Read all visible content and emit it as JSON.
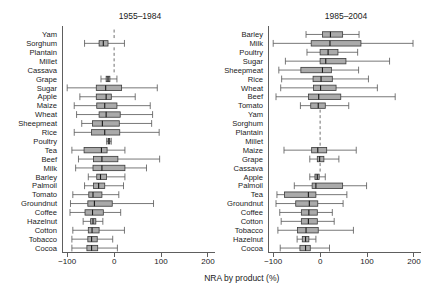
{
  "figure": {
    "axis_title": "NRA by product (%)",
    "tick_labels": [
      "-100",
      "0",
      "100",
      "200"
    ],
    "tick_values": [
      -100,
      0,
      100,
      200
    ],
    "axis_min": -110,
    "axis_max": 215,
    "box_fill_color": "#aaaaaa",
    "box_stroke_color": "#3a3a3a",
    "whisker_color": "#555555",
    "axis_color": "#4d4d4d"
  },
  "chart_data": {
    "type": "box",
    "title": "",
    "xlabel": "NRA by product (%)",
    "ylabel": "",
    "xlim": [
      -110,
      215
    ],
    "grid": false,
    "legend": "none",
    "panels": [
      {
        "label": "1955–1984",
        "categories": [
          "Yam",
          "Sorghum",
          "Plantain",
          "Millet",
          "Cassava",
          "Grape",
          "Sugar",
          "Apple",
          "Maize",
          "Wheat",
          "Sheepmeat",
          "Rice",
          "Poultry",
          "Tea",
          "Beef",
          "Milk",
          "Barley",
          "Palmoil",
          "Tomato",
          "Groundnut",
          "Coffee",
          "Hazelnut",
          "Cotton",
          "Tobacco",
          "Cocoa"
        ],
        "boxes": [
          {
            "category": "Yam",
            "empty": true
          },
          {
            "category": "Sorghum",
            "min": -63,
            "q1": -32,
            "median": -23,
            "q3": -13,
            "max": 22
          },
          {
            "category": "Plantain",
            "empty": true
          },
          {
            "category": "Millet",
            "empty": true
          },
          {
            "category": "Cassava",
            "empty": true
          },
          {
            "category": "Grape",
            "min": -28,
            "q1": -17,
            "median": -13,
            "q3": -9,
            "max": 6
          },
          {
            "category": "Sugar",
            "min": -100,
            "q1": -38,
            "median": -18,
            "q3": 16,
            "max": 92
          },
          {
            "category": "Apple",
            "min": -73,
            "q1": -38,
            "median": -17,
            "q3": -6,
            "max": 45
          },
          {
            "category": "Maize",
            "min": -85,
            "q1": -37,
            "median": -20,
            "q3": 6,
            "max": 77
          },
          {
            "category": "Wheat",
            "min": -80,
            "q1": -32,
            "median": -17,
            "q3": 13,
            "max": 82
          },
          {
            "category": "Sheepmeat",
            "min": -69,
            "q1": -46,
            "median": -25,
            "q3": 11,
            "max": 80
          },
          {
            "category": "Rice",
            "min": -85,
            "q1": -48,
            "median": -20,
            "q3": 12,
            "max": 96
          },
          {
            "category": "Poultry",
            "min": -16,
            "q1": -13,
            "median": -11,
            "q3": -9,
            "max": -6
          },
          {
            "category": "Tea",
            "min": -90,
            "q1": -64,
            "median": -27,
            "q3": -15,
            "max": 23
          },
          {
            "category": "Beef",
            "min": -76,
            "q1": -44,
            "median": -26,
            "q3": 8,
            "max": 97
          },
          {
            "category": "Milk",
            "min": -82,
            "q1": -45,
            "median": -26,
            "q3": 23,
            "max": 69
          },
          {
            "category": "Barley",
            "min": -55,
            "q1": -37,
            "median": -29,
            "q3": -16,
            "max": 23
          },
          {
            "category": "Palmoil",
            "min": -63,
            "q1": -44,
            "median": -33,
            "q3": -20,
            "max": 20
          },
          {
            "category": "Tomato",
            "min": -88,
            "q1": -54,
            "median": -45,
            "q3": -26,
            "max": 10
          },
          {
            "category": "Groundnut",
            "min": -93,
            "q1": -56,
            "median": -42,
            "q3": -4,
            "max": 84
          },
          {
            "category": "Coffee",
            "min": -94,
            "q1": -62,
            "median": -46,
            "q3": -23,
            "max": 14
          },
          {
            "category": "Hazelnut",
            "min": -66,
            "q1": -50,
            "median": -45,
            "q3": -39,
            "max": -24
          },
          {
            "category": "Cotton",
            "min": -88,
            "q1": -55,
            "median": -47,
            "q3": -32,
            "max": 22
          },
          {
            "category": "Tobacco",
            "min": -90,
            "q1": -56,
            "median": -48,
            "q3": -36,
            "max": -3
          },
          {
            "category": "Cocoa",
            "min": -90,
            "q1": -58,
            "median": -48,
            "q3": -35,
            "max": 7
          }
        ]
      },
      {
        "label": "1985–2004",
        "categories": [
          "Barley",
          "Milk",
          "Poultry",
          "Sugar",
          "Sheepmeat",
          "Rice",
          "Wheat",
          "Beef",
          "Tomato",
          "Yam",
          "Sorghum",
          "Plantain",
          "Millet",
          "Maize",
          "Grape",
          "Cassava",
          "Apple",
          "Palmoil",
          "Tea",
          "Groundnut",
          "Coffee",
          "Cotton",
          "Tobacco",
          "Hazelnut",
          "Cocoa"
        ],
        "boxes": [
          {
            "category": "Barley",
            "min": -30,
            "q1": 5,
            "median": 22,
            "q3": 48,
            "max": 83
          },
          {
            "category": "Milk",
            "min": -100,
            "q1": -19,
            "median": 21,
            "q3": 87,
            "max": 198
          },
          {
            "category": "Poultry",
            "min": -28,
            "q1": 0,
            "median": 17,
            "q3": 38,
            "max": 80
          },
          {
            "category": "Sugar",
            "min": -74,
            "q1": 0,
            "median": 12,
            "q3": 55,
            "max": 148
          },
          {
            "category": "Sheepmeat",
            "min": -88,
            "q1": -41,
            "median": 5,
            "q3": 24,
            "max": 82
          },
          {
            "category": "Rice",
            "min": -82,
            "q1": -15,
            "median": 2,
            "q3": 26,
            "max": 103
          },
          {
            "category": "Wheat",
            "min": -84,
            "q1": -14,
            "median": 1,
            "q3": 34,
            "max": 122
          },
          {
            "category": "Beef",
            "min": -94,
            "q1": -25,
            "median": -3,
            "q3": 44,
            "max": 160
          },
          {
            "category": "Tomato",
            "min": -42,
            "q1": -20,
            "median": -4,
            "q3": 11,
            "max": 61
          },
          {
            "category": "Yam",
            "empty": true
          },
          {
            "category": "Sorghum",
            "empty": true
          },
          {
            "category": "Plantain",
            "empty": true
          },
          {
            "category": "Millet",
            "empty": true
          },
          {
            "category": "Maize",
            "min": -77,
            "q1": -18,
            "median": -5,
            "q3": 14,
            "max": 77
          },
          {
            "category": "Grape",
            "min": -22,
            "q1": -6,
            "median": -1,
            "q3": 8,
            "max": 40
          },
          {
            "category": "Cassava",
            "empty": true
          },
          {
            "category": "Apple",
            "min": -22,
            "q1": -11,
            "median": -6,
            "q3": -2,
            "max": 11
          },
          {
            "category": "Palmoil",
            "min": -55,
            "q1": -17,
            "median": -9,
            "q3": 48,
            "max": 99
          },
          {
            "category": "Tea",
            "min": -92,
            "q1": -76,
            "median": -25,
            "q3": -9,
            "max": 57
          },
          {
            "category": "Groundnut",
            "min": -94,
            "q1": -52,
            "median": -23,
            "q3": -5,
            "max": 49
          },
          {
            "category": "Coffee",
            "min": -86,
            "q1": -40,
            "median": -24,
            "q3": -6,
            "max": 26
          },
          {
            "category": "Cotton",
            "min": -83,
            "q1": -40,
            "median": -25,
            "q3": -6,
            "max": 30
          },
          {
            "category": "Tobacco",
            "min": -90,
            "q1": -48,
            "median": -30,
            "q3": -4,
            "max": 71
          },
          {
            "category": "Hazelnut",
            "min": -49,
            "q1": -38,
            "median": -31,
            "q3": -24,
            "max": -9
          },
          {
            "category": "Cocoa",
            "min": -85,
            "q1": -43,
            "median": -31,
            "q3": -21,
            "max": 20
          }
        ]
      }
    ]
  }
}
